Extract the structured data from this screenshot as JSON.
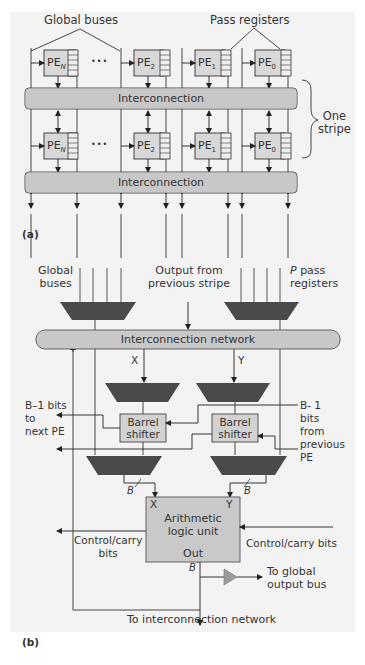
{
  "figure_a": {
    "panel_label": "(a)",
    "callouts": {
      "global_buses": "Global buses",
      "pass_registers": "Pass registers",
      "one_stripe": "One\nstripe"
    },
    "pe_row_1": [
      {
        "name": "PE",
        "sub": "N"
      },
      {
        "name": "PE",
        "sub": "2"
      },
      {
        "name": "PE",
        "sub": "1"
      },
      {
        "name": "PE",
        "sub": "0"
      }
    ],
    "pe_row_2": [
      {
        "name": "PE",
        "sub": "N"
      },
      {
        "name": "PE",
        "sub": "2"
      },
      {
        "name": "PE",
        "sub": "1"
      },
      {
        "name": "PE",
        "sub": "0"
      }
    ],
    "ellipsis": "•••",
    "interconnection_1": "Interconnection",
    "interconnection_2": "Interconnection"
  },
  "figure_b": {
    "panel_label": "(b)",
    "global_buses": "Global\nbuses",
    "output_prev_stripe": "Output from\nprevious stripe",
    "p_pass_registers_italic": "P",
    "p_pass_registers": " pass\nregisters",
    "interconnection_network": "Interconnection network",
    "x_label": "X",
    "y_label": "Y",
    "b_minus_1_to_next": "B–1 bits\nto\nnext PE",
    "b_minus_1_from_prev": "B- 1\nbits\nfrom\nprevious\nPE",
    "barrel_shifter_left": "Barrel\nshifter",
    "barrel_shifter_right": "Barrel\nshifter",
    "b_width_left": "B",
    "b_width_right": "B",
    "b_width_out": "B",
    "alu_x": "X",
    "alu_y": "Y",
    "alu_label": "Arithmetic\nlogic unit",
    "alu_out": "Out",
    "control_carry_left": "Control/carry\nbits",
    "control_carry_right": "Control/carry bits",
    "to_global_output_bus": "To global\noutput bus",
    "to_interconnection_network": "To interconnection network"
  },
  "colors": {
    "background": "#f3f3f3",
    "box_fill": "#d2d2d2",
    "bus_fill": "#c8c8c8",
    "mux_fill": "#4a4a4a",
    "line": "#333333",
    "buffer_fill": "#9a9a9a"
  }
}
